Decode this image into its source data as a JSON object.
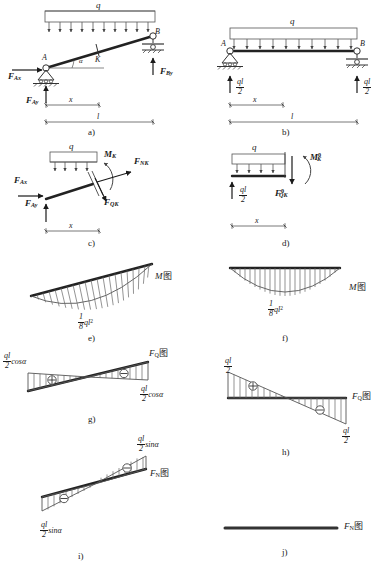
{
  "figure": {
    "line_color": "#1a1a1a",
    "hatch_color": "#555555",
    "beam_color": "#222222"
  },
  "panels": [
    {
      "tag": "a)",
      "description": "Inclined beam AB with uniform load q and support reactions",
      "labels": {
        "load": "q",
        "point_a": "A",
        "point_b": "B",
        "point_k": "K",
        "angle": "α",
        "reaction_ax": "F",
        "reaction_ax_sub": "Ax",
        "reaction_ay": "F",
        "reaction_ay_sub": "Ay",
        "reaction_by": "F",
        "reaction_by_sub": "By",
        "dim_x": "x",
        "dim_l": "l"
      }
    },
    {
      "tag": "b)",
      "description": "Equivalent horizontal beam AB with uniform load q and ql/2 reactions",
      "labels": {
        "load": "q",
        "point_a": "A",
        "point_b": "B",
        "reaction_left_num": "ql",
        "reaction_left_den": "2",
        "reaction_right_num": "ql",
        "reaction_right_den": "2",
        "dim_x": "x",
        "dim_l": "l"
      }
    },
    {
      "tag": "c)",
      "description": "Free body of inclined beam segment A-K showing internal forces at K",
      "labels": {
        "load": "q",
        "moment_k": "M",
        "moment_k_sub": "K",
        "axial_k": "F",
        "axial_k_sub": "NK",
        "shear_k": "F",
        "shear_k_sub": "QK",
        "reaction_ax": "F",
        "reaction_ax_sub": "Ax",
        "reaction_ay": "F",
        "reaction_ay_sub": "Ay",
        "dim_x": "x"
      }
    },
    {
      "tag": "d)",
      "description": "Free body of horizontal reference beam segment showing M_K0 and F_QK0",
      "labels": {
        "load": "q",
        "moment_k": "M",
        "moment_k_sub": "K",
        "moment_k_sup": "0",
        "shear_k": "F",
        "shear_k_sub": "QK",
        "shear_k_sup": "0",
        "reaction_num": "ql",
        "reaction_den": "2",
        "dim_x": "x"
      }
    },
    {
      "tag": "e)",
      "description": "Bending moment diagram for inclined beam, parabolic, max ql^2/8",
      "labels": {
        "diagram_name": "M",
        "diagram_cn": "图",
        "peak_num": "1",
        "peak_den": "8",
        "peak_expr": "ql",
        "peak_exp": "2"
      }
    },
    {
      "tag": "f)",
      "description": "Bending moment diagram for horizontal beam, parabolic, max ql^2/8",
      "labels": {
        "diagram_name": "M",
        "diagram_cn": "图",
        "peak_num": "1",
        "peak_den": "8",
        "peak_expr": "ql",
        "peak_exp": "2"
      }
    },
    {
      "tag": "g)",
      "description": "Shear force diagram for inclined beam, end values ql/2 cos alpha",
      "labels": {
        "diagram_name": "F",
        "diagram_sub": "Q",
        "diagram_cn": "图",
        "left_num": "ql",
        "left_den": "2",
        "left_trig": "cosα",
        "right_num": "ql",
        "right_den": "2",
        "right_trig": "cosα",
        "sign_left": "⊕",
        "sign_right": "⊖"
      }
    },
    {
      "tag": "h)",
      "description": "Shear force diagram for horizontal beam, end values ql/2",
      "labels": {
        "diagram_name": "F",
        "diagram_sub": "Q",
        "diagram_cn": "图",
        "left_num": "ql",
        "left_den": "2",
        "right_num": "ql",
        "right_den": "2",
        "sign_left": "⊕",
        "sign_right": "⊖"
      }
    },
    {
      "tag": "i)",
      "description": "Axial force diagram for inclined beam, end values ql/2 sin alpha",
      "labels": {
        "diagram_name": "F",
        "diagram_sub": "N",
        "diagram_cn": "图",
        "top_num": "ql",
        "top_den": "2",
        "top_trig": "sinα",
        "bot_num": "ql",
        "bot_den": "2",
        "bot_trig": "sinα",
        "sign_top": "⊖",
        "sign_bot": "⊖"
      }
    },
    {
      "tag": "j)",
      "description": "Axial force diagram for horizontal beam, identically zero",
      "labels": {
        "diagram_name": "F",
        "diagram_sub": "N",
        "diagram_cn": "图"
      }
    }
  ]
}
